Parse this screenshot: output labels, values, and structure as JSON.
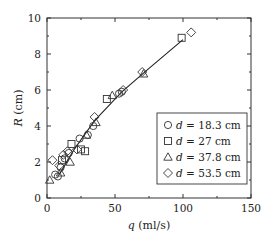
{
  "chart_data": {
    "type": "scatter",
    "title": "",
    "xlabel": "q (ml/s)",
    "ylabel": "R (cm)",
    "xlim": [
      0,
      150
    ],
    "ylim": [
      0,
      10
    ],
    "xticks": [
      0,
      50,
      100,
      150
    ],
    "yticks": [
      0,
      2,
      4,
      6,
      8,
      10
    ],
    "grid": false,
    "legend_position": "lower right",
    "series": [
      {
        "name": "d = 18.3 cm",
        "marker": "circle",
        "points": [
          [
            6,
            1.3
          ],
          [
            8,
            1.2
          ],
          [
            10,
            1.7
          ],
          [
            13,
            2.2
          ],
          [
            16,
            2.5
          ],
          [
            24,
            3.3
          ],
          [
            30,
            3.5
          ],
          [
            34,
            4.0
          ],
          [
            53,
            5.8
          ],
          [
            55,
            5.9
          ]
        ]
      },
      {
        "name": "d = 27 cm",
        "marker": "square",
        "points": [
          [
            11,
            2.1
          ],
          [
            18,
            3.0
          ],
          [
            25,
            2.7
          ],
          [
            28,
            2.6
          ],
          [
            44,
            5.5
          ],
          [
            99,
            8.9
          ]
        ]
      },
      {
        "name": "d = 37.8 cm",
        "marker": "triangle",
        "points": [
          [
            2,
            1.0
          ],
          [
            10,
            1.4
          ],
          [
            17,
            2.0
          ],
          [
            29,
            3.5
          ],
          [
            36,
            4.2
          ],
          [
            48,
            5.7
          ],
          [
            71,
            6.9
          ]
        ]
      },
      {
        "name": "d = 53.5 cm",
        "marker": "diamond",
        "points": [
          [
            4,
            2.1
          ],
          [
            9,
            1.8
          ],
          [
            12,
            2.4
          ],
          [
            15,
            2.6
          ],
          [
            22,
            2.7
          ],
          [
            35,
            4.5
          ],
          [
            56,
            6.0
          ],
          [
            70,
            7.0
          ],
          [
            106,
            9.2
          ]
        ]
      }
    ],
    "fit_line": {
      "points": [
        [
          9,
          1.3
        ],
        [
          20,
          2.7
        ],
        [
          35,
          4.3
        ],
        [
          55,
          5.9
        ],
        [
          75,
          7.2
        ],
        [
          100,
          8.8
        ]
      ]
    }
  },
  "axes": {
    "x_label": "q (ml/s)",
    "y_label": "R (cm)",
    "x_tick_labels": [
      "0",
      "50",
      "100",
      "150"
    ],
    "y_tick_labels": [
      "0",
      "2",
      "4",
      "6",
      "8",
      "10"
    ]
  },
  "legend": {
    "entries": [
      {
        "symbol": "○",
        "label": "d = 18.3 cm"
      },
      {
        "symbol": "□",
        "label": "d = 27 cm"
      },
      {
        "symbol": "△",
        "label": "d = 37.8 cm"
      },
      {
        "symbol": "◇",
        "label": "d = 53.5 cm"
      }
    ]
  }
}
